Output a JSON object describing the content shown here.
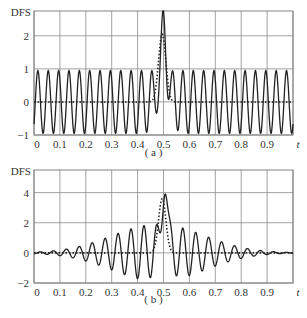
{
  "chart_data": [
    {
      "type": "line",
      "panel_label": "(a)",
      "ylabel": "DFS",
      "xlabel": "t",
      "xlim": [
        0,
        1.0
      ],
      "ylim": [
        -1,
        2.75
      ],
      "xticks": [
        "0",
        "0.1",
        "0.2",
        "0.3",
        "0.4",
        "0.5",
        "0.6",
        "0.7",
        "0.8",
        "0.9"
      ],
      "yticks": [
        "-1",
        "0",
        "1",
        "2"
      ],
      "ytick_values": [
        -1,
        0,
        1,
        2
      ],
      "grid": true,
      "series": [
        {
          "name": "solid",
          "style": "solid",
          "description": "constant-amplitude oscillation (amplitude ~0.95, period ~0.04) plus a peak near t=0.5",
          "amplitude": 0.95,
          "period": 0.04,
          "peak_t": 0.5,
          "peak_value": 2.55
        },
        {
          "name": "dotted",
          "style": "dotted",
          "description": "baseline 0 with single pulse near t=0.5",
          "peak_t": 0.495,
          "peak_value": 2.05,
          "width": 0.02
        }
      ]
    },
    {
      "type": "line",
      "panel_label": "(b)",
      "ylabel": "DFS",
      "xlabel": "t",
      "xlim": [
        0,
        1.0
      ],
      "ylim": [
        -2,
        5.5
      ],
      "xticks": [
        "0",
        "0.1",
        "0.2",
        "0.3",
        "0.4",
        "0.5",
        "0.6",
        "0.7",
        "0.8",
        "0.9"
      ],
      "yticks": [
        "-2",
        "0",
        "2",
        "4"
      ],
      "ytick_values": [
        -2,
        0,
        2,
        4
      ],
      "grid": true,
      "series": [
        {
          "name": "solid",
          "style": "solid",
          "description": "oscillation with amplitude growing toward t=0.5 (~1.9) and decaying after, peak near t=0.5",
          "max_amplitude": 1.9,
          "period": 0.05,
          "peak_t": 0.5,
          "peak_value": 4.9
        },
        {
          "name": "dotted",
          "style": "dotted",
          "description": "baseline 0 with single pulse near t=0.5",
          "peak_t": 0.495,
          "peak_value": 3.6,
          "width": 0.02
        }
      ]
    }
  ]
}
